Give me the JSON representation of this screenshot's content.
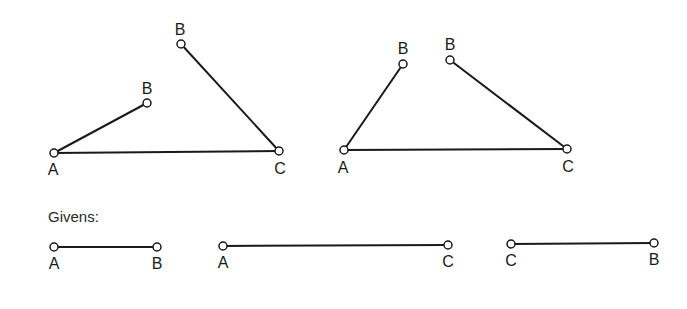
{
  "figures": [
    {
      "name": "triangle-left",
      "points": [
        {
          "label": "A",
          "x": 54,
          "y": 153,
          "lx": 53,
          "ly": 175
        },
        {
          "label": "B",
          "x": 147,
          "y": 103,
          "lx": 147,
          "ly": 94
        },
        {
          "label": "B",
          "x": 181,
          "y": 44,
          "lx": 180,
          "ly": 35
        },
        {
          "label": "C",
          "x": 279,
          "y": 151,
          "lx": 280,
          "ly": 174
        }
      ],
      "segments": [
        [
          0,
          1
        ],
        [
          0,
          3
        ],
        [
          2,
          3
        ]
      ]
    },
    {
      "name": "triangle-right",
      "points": [
        {
          "label": "A",
          "x": 344,
          "y": 150,
          "lx": 343,
          "ly": 173
        },
        {
          "label": "B",
          "x": 403,
          "y": 64,
          "lx": 403,
          "ly": 54
        },
        {
          "label": "B",
          "x": 450,
          "y": 60,
          "lx": 450,
          "ly": 50
        },
        {
          "label": "C",
          "x": 567,
          "y": 149,
          "lx": 568,
          "ly": 172
        }
      ],
      "segments": [
        [
          0,
          1
        ],
        [
          0,
          3
        ],
        [
          2,
          3
        ]
      ]
    }
  ],
  "givens": {
    "title": "Givens:",
    "segments": [
      {
        "name": "segment-AB",
        "p1": {
          "label": "A",
          "x": 54,
          "y": 247
        },
        "p2": {
          "label": "B",
          "x": 157,
          "y": 247
        }
      },
      {
        "name": "segment-AC",
        "p1": {
          "label": "A",
          "x": 223,
          "y": 246
        },
        "p2": {
          "label": "C",
          "x": 448,
          "y": 245
        }
      },
      {
        "name": "segment-CB",
        "p1": {
          "label": "C",
          "x": 511,
          "y": 244
        },
        "p2": {
          "label": "B",
          "x": 654,
          "y": 243
        }
      }
    ]
  }
}
